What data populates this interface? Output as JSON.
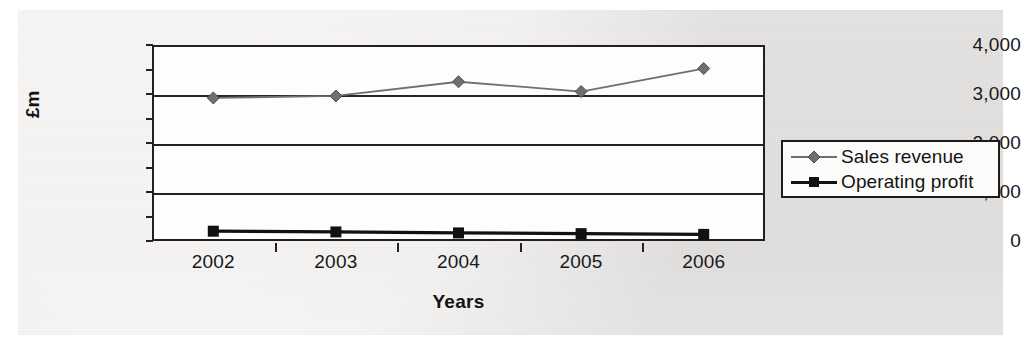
{
  "chart_data": {
    "type": "line",
    "title": "",
    "xlabel": "Years",
    "ylabel": "£m",
    "categories": [
      "2002",
      "2003",
      "2004",
      "2005",
      "2006"
    ],
    "ylim": [
      0,
      4000
    ],
    "yticks": [
      "0",
      "1,000",
      "2,000",
      "3,000",
      "4,000"
    ],
    "ytick_values": [
      0,
      1000,
      2000,
      3000,
      4000
    ],
    "grid": true,
    "legend_position": "right",
    "series": [
      {
        "name": "Sales revenue",
        "marker": "diamond",
        "color": "#6f6f6f",
        "values": [
          2920,
          2960,
          3250,
          3050,
          3520
        ]
      },
      {
        "name": "Operating profit",
        "marker": "square",
        "color": "#111111",
        "values": [
          200,
          185,
          165,
          150,
          135
        ]
      }
    ]
  },
  "legend": {
    "entries": [
      {
        "label": "Sales revenue",
        "marker": "diamond-marker-icon"
      },
      {
        "label": "Operating profit",
        "marker": "square-marker-icon"
      }
    ]
  },
  "colors": {
    "sales_revenue": "#6f6f6f",
    "operating_profit": "#111111",
    "axis": "#262223",
    "paper": "#eceae8",
    "plot_background": "#fdfdfd"
  }
}
